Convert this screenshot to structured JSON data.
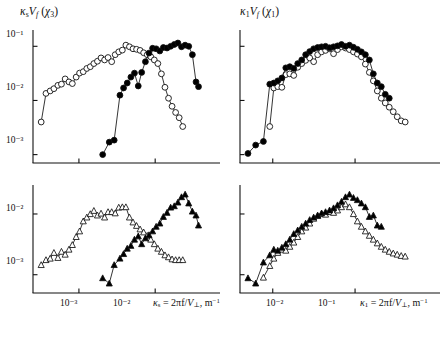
{
  "figure": {
    "background": "#ffffff",
    "ink": "#111111",
    "marker_fill": "#000000",
    "marker_open": "#ffffff"
  },
  "panels": [
    {
      "id": "top-left",
      "ylabel_kappa": "κ",
      "ylabel_kappa_sub": "s",
      "ylabel_v": "V",
      "ylabel_v_sub": "f",
      "ylabel_arg_open": " (",
      "ylabel_chi": "χ",
      "ylabel_chi_sub": "3",
      "ylabel_arg_close": ")",
      "ylabel_plain": "κs Vf (χ3)",
      "yticks": [
        "10⁻¹",
        "10⁻²",
        "10⁻³"
      ],
      "ytick_values": [
        -1,
        -2,
        -3
      ],
      "xticks_shown": [],
      "xaxis_title": "",
      "series": [
        "open-circles",
        "filled-circles"
      ]
    },
    {
      "id": "top-right",
      "ylabel_kappa": "κ",
      "ylabel_kappa_sub": "1",
      "ylabel_v": "V",
      "ylabel_v_sub": "f",
      "ylabel_arg_open": " (",
      "ylabel_chi": "χ",
      "ylabel_chi_sub": "1",
      "ylabel_arg_close": ")",
      "ylabel_plain": "κ1 Vf (χ1)",
      "yticks": [],
      "ytick_values": [
        -1,
        -2,
        -3
      ],
      "xticks_shown": [],
      "xaxis_title": "",
      "series": [
        "open-circles",
        "filled-circles"
      ]
    },
    {
      "id": "bottom-left",
      "ylabel_plain": "",
      "yticks": [
        "10⁻²",
        "10⁻³"
      ],
      "ytick_values": [
        -2,
        -3
      ],
      "xticks": [
        "10⁻³",
        "10⁻²"
      ],
      "xaxis_title_kappa": "κ",
      "xaxis_title_kappa_sub": "s",
      "xaxis_title_body": " = 2πf/",
      "xaxis_title_v": "V",
      "xaxis_title_v_sub": "⊥",
      "xaxis_title_units": ", m",
      "xaxis_title_units_sup": "−1",
      "xaxis_title_plain": "κs = 2πf/V⊥, m⁻¹",
      "series": [
        "open-triangles",
        "filled-triangles"
      ]
    },
    {
      "id": "bottom-right",
      "ylabel_plain": "",
      "yticks": [],
      "ytick_values": [
        -2,
        -3
      ],
      "xticks": [
        "10⁻²",
        "10⁻¹"
      ],
      "xaxis_title_kappa": "κ",
      "xaxis_title_kappa_sub": "1",
      "xaxis_title_body": " = 2πf/",
      "xaxis_title_v": "V",
      "xaxis_title_v_sub": "⊥",
      "xaxis_title_units": ", m",
      "xaxis_title_units_sup": "−1",
      "xaxis_title_plain": "κ1 = 2πf/V⊥, m⁻¹",
      "series": [
        "open-triangles",
        "filled-triangles"
      ]
    }
  ],
  "chart_data": [
    {
      "type": "line",
      "id": "top-left",
      "title": "κs Vf (χ3)",
      "xlabel": "κs = 2πf/V⊥, m⁻¹",
      "ylabel": "κs Vf (χ3)",
      "xscale": "log",
      "yscale": "log",
      "xlim": [
        0.00025,
        0.045
      ],
      "ylim": [
        0.0007,
        0.2
      ],
      "xticks": [
        0.001,
        0.01
      ],
      "yticks": [
        0.1,
        0.01,
        0.001
      ],
      "grid": false,
      "legend": null,
      "series": [
        {
          "name": "open-circles",
          "marker": "circle-open",
          "x": [
            0.00032,
            0.00037,
            0.00042,
            0.00047,
            0.00053,
            0.00059,
            0.00066,
            0.00074,
            0.00082,
            0.00092,
            0.00102,
            0.00114,
            0.00127,
            0.00141,
            0.00157,
            0.00175,
            0.00195,
            0.00217,
            0.00241,
            0.00269,
            0.00299,
            0.00333,
            0.00371,
            0.00413,
            0.0046,
            0.00512,
            0.0057,
            0.00634,
            0.00706,
            0.00786,
            0.00875,
            0.00974,
            0.01084,
            0.01207,
            0.01344,
            0.01496,
            0.01665,
            0.01854,
            0.02064,
            0.02298
          ],
          "y": [
            0.004,
            0.0135,
            0.015,
            0.0165,
            0.019,
            0.02,
            0.025,
            0.022,
            0.0205,
            0.027,
            0.032,
            0.034,
            0.039,
            0.042,
            0.048,
            0.053,
            0.061,
            0.056,
            0.062,
            0.052,
            0.07,
            0.079,
            0.085,
            0.105,
            0.098,
            0.09,
            0.088,
            0.084,
            0.076,
            0.07,
            0.064,
            0.056,
            0.048,
            0.031,
            0.0175,
            0.011,
            0.0078,
            0.006,
            0.0048,
            0.0033
          ]
        },
        {
          "name": "filled-circles",
          "marker": "circle-filled",
          "x": [
            0.00205,
            0.0025,
            0.0029,
            0.00345,
            0.00385,
            0.0043,
            0.0048,
            0.00535,
            0.006,
            0.00665,
            0.00745,
            0.0083,
            0.00925,
            0.0103,
            0.0115,
            0.0128,
            0.0143,
            0.01595,
            0.0178,
            0.01985,
            0.02215,
            0.0247,
            0.02755,
            0.03075,
            0.0343,
            0.037
          ],
          "y": [
            0.001,
            0.0017,
            0.00185,
            0.0125,
            0.017,
            0.021,
            0.027,
            0.032,
            0.0185,
            0.033,
            0.052,
            0.075,
            0.092,
            0.09,
            0.082,
            0.095,
            0.093,
            0.1,
            0.108,
            0.115,
            0.098,
            0.105,
            0.1,
            0.07,
            0.022,
            0.018
          ]
        }
      ]
    },
    {
      "type": "line",
      "id": "top-right",
      "title": "κ1 Vf (χ1)",
      "xlabel": "κ1 = 2πf/V⊥, m⁻¹",
      "ylabel": "κ1 Vf (χ1)",
      "xscale": "log",
      "yscale": "log",
      "xlim": [
        0.004,
        0.55
      ],
      "ylim": [
        0.0007,
        0.2
      ],
      "xticks": [
        0.01,
        0.1
      ],
      "yticks": [
        0.1,
        0.01,
        0.001
      ],
      "grid": false,
      "legend": null,
      "series": [
        {
          "name": "open-circles",
          "marker": "circle-open",
          "x": [
            0.0092,
            0.0103,
            0.0115,
            0.0129,
            0.0144,
            0.0161,
            0.018,
            0.0201,
            0.0225,
            0.0251,
            0.0281,
            0.0314,
            0.0351,
            0.0392,
            0.0438,
            0.049,
            0.0548,
            0.0612,
            0.0684,
            0.0765,
            0.0855,
            0.0956,
            0.1068,
            0.1194,
            0.1335,
            0.1492,
            0.1668,
            0.1864,
            0.2084,
            0.2329,
            0.2603,
            0.291,
            0.3253,
            0.3636,
            0.4064
          ],
          "y": [
            0.0033,
            0.017,
            0.018,
            0.0175,
            0.03,
            0.031,
            0.029,
            0.041,
            0.048,
            0.055,
            0.061,
            0.052,
            0.07,
            0.079,
            0.084,
            0.09,
            0.073,
            0.087,
            0.098,
            0.093,
            0.087,
            0.079,
            0.072,
            0.064,
            0.047,
            0.033,
            0.023,
            0.015,
            0.011,
            0.009,
            0.0075,
            0.0062,
            0.005,
            0.0042,
            0.004
          ]
        },
        {
          "name": "filled-circles",
          "marker": "circle-filled",
          "x": [
            0.005,
            0.0062,
            0.0077,
            0.0092,
            0.0103,
            0.0115,
            0.0129,
            0.0144,
            0.0161,
            0.018,
            0.0201,
            0.0225,
            0.0251,
            0.0281,
            0.0314,
            0.0351,
            0.0392,
            0.0438,
            0.049,
            0.0548,
            0.0612,
            0.0684,
            0.0765,
            0.0855,
            0.0956,
            0.1068,
            0.1194,
            0.1335,
            0.1492,
            0.1668,
            0.1864,
            0.2084,
            0.2329,
            0.2603
          ],
          "y": [
            0.00105,
            0.0015,
            0.00175,
            0.02,
            0.021,
            0.023,
            0.026,
            0.04,
            0.042,
            0.039,
            0.048,
            0.056,
            0.07,
            0.08,
            0.09,
            0.095,
            0.098,
            0.1,
            0.094,
            0.098,
            0.102,
            0.108,
            0.1,
            0.105,
            0.096,
            0.088,
            0.079,
            0.07,
            0.056,
            0.031,
            0.021,
            0.018,
            0.013,
            0.011
          ]
        }
      ]
    },
    {
      "type": "line",
      "id": "bottom-left",
      "title": "",
      "xlabel": "κs = 2πf/V⊥, m⁻¹",
      "ylabel": "",
      "xscale": "log",
      "yscale": "log",
      "xlim": [
        0.00025,
        0.045
      ],
      "ylim": [
        0.0005,
        0.03
      ],
      "xticks": [
        0.001,
        0.01
      ],
      "yticks": [
        0.01,
        0.001
      ],
      "grid": false,
      "legend": null,
      "series": [
        {
          "name": "open-triangles",
          "marker": "triangle-open",
          "x": [
            0.00032,
            0.00037,
            0.00042,
            0.00047,
            0.00053,
            0.00059,
            0.00066,
            0.00074,
            0.00082,
            0.00092,
            0.00102,
            0.00114,
            0.00127,
            0.00141,
            0.00157,
            0.00175,
            0.00195,
            0.00217,
            0.00241,
            0.00269,
            0.00299,
            0.00333,
            0.00371,
            0.00413,
            0.0046,
            0.00512,
            0.0057,
            0.00634,
            0.00706,
            0.00786,
            0.00875,
            0.00974,
            0.01084,
            0.01207,
            0.01344,
            0.01496,
            0.01665,
            0.01854,
            0.02064,
            0.02298
          ],
          "y": [
            0.00145,
            0.00175,
            0.00185,
            0.0023,
            0.0019,
            0.0024,
            0.00215,
            0.0026,
            0.0031,
            0.0042,
            0.0052,
            0.0076,
            0.0088,
            0.01,
            0.0113,
            0.0095,
            0.0102,
            0.0088,
            0.0108,
            0.0108,
            0.0103,
            0.0128,
            0.013,
            0.013,
            0.0088,
            0.0073,
            0.0064,
            0.0056,
            0.005,
            0.0044,
            0.0038,
            0.0032,
            0.0027,
            0.0024,
            0.0021,
            0.00195,
            0.0018,
            0.00175,
            0.00175,
            0.00175
          ]
        },
        {
          "name": "filled-triangles",
          "marker": "triangle-filled",
          "x": [
            0.00205,
            0.0025,
            0.0029,
            0.00345,
            0.00385,
            0.0043,
            0.0048,
            0.00535,
            0.006,
            0.00665,
            0.00745,
            0.0083,
            0.00925,
            0.0103,
            0.0115,
            0.0128,
            0.0143,
            0.01595,
            0.0178,
            0.01985,
            0.02215,
            0.0247,
            0.02755,
            0.03075,
            0.0343,
            0.037
          ],
          "y": [
            0.00088,
            0.00072,
            0.00145,
            0.00185,
            0.0022,
            0.0027,
            0.003,
            0.0038,
            0.0043,
            0.0032,
            0.004,
            0.0045,
            0.0052,
            0.0062,
            0.007,
            0.009,
            0.0105,
            0.0128,
            0.0135,
            0.0155,
            0.019,
            0.021,
            0.015,
            0.011,
            0.0095,
            0.0065
          ]
        }
      ]
    },
    {
      "type": "line",
      "id": "bottom-right",
      "title": "",
      "xlabel": "κ1 = 2πf/V⊥, m⁻¹",
      "ylabel": "",
      "xscale": "log",
      "yscale": "log",
      "xlim": [
        0.004,
        0.55
      ],
      "ylim": [
        0.0005,
        0.03
      ],
      "xticks": [
        0.01,
        0.1
      ],
      "yticks": [
        0.01,
        0.001
      ],
      "grid": false,
      "legend": null,
      "series": [
        {
          "name": "open-triangles",
          "marker": "triangle-open",
          "x": [
            0.0077,
            0.0092,
            0.0103,
            0.0115,
            0.0129,
            0.0144,
            0.0161,
            0.018,
            0.0201,
            0.0225,
            0.0251,
            0.0281,
            0.0314,
            0.0351,
            0.0392,
            0.0438,
            0.049,
            0.0548,
            0.0612,
            0.0684,
            0.0765,
            0.0855,
            0.0956,
            0.1068,
            0.1194,
            0.1335,
            0.1492,
            0.1668,
            0.1864,
            0.2084,
            0.2329,
            0.2603,
            0.291,
            0.3253,
            0.3636,
            0.4064
          ],
          "y": [
            0.0009,
            0.0014,
            0.00185,
            0.0023,
            0.0026,
            0.0025,
            0.0029,
            0.0034,
            0.0042,
            0.0052,
            0.006,
            0.007,
            0.0084,
            0.0093,
            0.01,
            0.0098,
            0.0108,
            0.0105,
            0.0115,
            0.013,
            0.0145,
            0.013,
            0.01,
            0.0076,
            0.0062,
            0.0052,
            0.0044,
            0.0038,
            0.0033,
            0.0029,
            0.0026,
            0.0024,
            0.00225,
            0.00215,
            0.00205,
            0.002
          ]
        },
        {
          "name": "filled-triangles",
          "marker": "triangle-filled",
          "x": [
            0.005,
            0.0062,
            0.0077,
            0.0092,
            0.0103,
            0.0115,
            0.0129,
            0.0144,
            0.0161,
            0.018,
            0.0201,
            0.0225,
            0.0251,
            0.0281,
            0.0314,
            0.0351,
            0.0392,
            0.0438,
            0.049,
            0.0548,
            0.0612,
            0.0684,
            0.0765,
            0.0855,
            0.0956,
            0.1068,
            0.1194,
            0.1335,
            0.1492,
            0.1668,
            0.1864,
            0.2084
          ],
          "y": [
            0.00088,
            0.00072,
            0.0016,
            0.0021,
            0.0026,
            0.0025,
            0.0028,
            0.0032,
            0.0038,
            0.0047,
            0.0054,
            0.0062,
            0.007,
            0.008,
            0.0088,
            0.0095,
            0.0103,
            0.0108,
            0.0115,
            0.0125,
            0.014,
            0.016,
            0.019,
            0.021,
            0.0185,
            0.017,
            0.015,
            0.013,
            0.009,
            0.0095,
            0.0065,
            0.0062
          ]
        }
      ]
    }
  ]
}
